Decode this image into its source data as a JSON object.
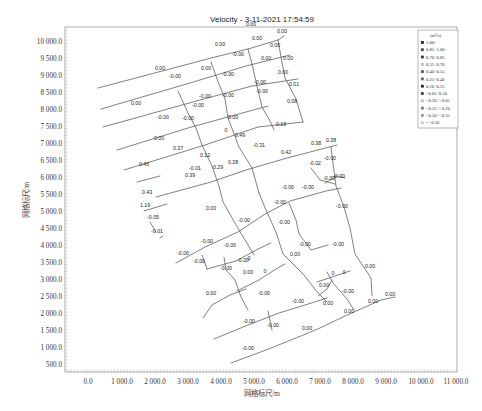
{
  "chart_data": {
    "type": "line",
    "title": "Velocity - 3-11-2021 17:54:59",
    "xlabel": "网格标尺/m",
    "ylabel": "网格标尺/m",
    "xlim": [
      -500,
      11500
    ],
    "ylim": [
      200,
      10400
    ],
    "xticks": [
      "0.0",
      "1 000.0",
      "2 000.0",
      "3 000.0",
      "4 000.0",
      "5 000.0",
      "6 000.0",
      "7 000.0",
      "8 000.0",
      "9 000.0",
      "10 000.0",
      "11 000.0"
    ],
    "yticks": [
      "10 000.0",
      "9 500.0",
      "9 000.0",
      "8 500.0",
      "8 000.0",
      "7 500.0",
      "7 000.0",
      "6 500.0",
      "6 000.0",
      "5 500.0",
      "5 000.0",
      "4 500.0",
      "4 000.0",
      "3 500.0",
      "3 000.0",
      "2 500.0",
      "2 000.0",
      "1 500.0",
      "1 000.0",
      "500.0"
    ],
    "grid": false,
    "legend_position": "upper-right",
    "legend": {
      "unit": "(m³/s)",
      "entries": [
        "1.00<",
        "0.85~1.00",
        "0.70~0.85",
        "0.55~0.70",
        "0.40~0.55",
        "0.25~0.40",
        "0.10~0.25",
        "−0.05~0.10",
        "−0.20~−0.05",
        "−0.35~−0.20",
        "−0.50~−0.35",
        "<−0.50"
      ]
    },
    "pipe_labels": [
      {
        "x": 282,
        "y": 33,
        "text": "0.00"
      },
      {
        "x": 257,
        "y": 40,
        "text": "0.00"
      },
      {
        "x": 220,
        "y": 46,
        "text": "0.00"
      },
      {
        "x": 275,
        "y": 47,
        "text": "0.00"
      },
      {
        "x": 160,
        "y": 70,
        "text": "0.00"
      },
      {
        "x": 206,
        "y": 70,
        "text": "0.00"
      },
      {
        "x": 238,
        "y": 56,
        "text": "-0.00"
      },
      {
        "x": 266,
        "y": 60,
        "text": "0.00"
      },
      {
        "x": 288,
        "y": 60,
        "text": "0.00"
      },
      {
        "x": 175,
        "y": 78,
        "text": "-0.00"
      },
      {
        "x": 228,
        "y": 76,
        "text": "-0.00"
      },
      {
        "x": 260,
        "y": 84,
        "text": "-0.00"
      },
      {
        "x": 283,
        "y": 74,
        "text": "0.00"
      },
      {
        "x": 205,
        "y": 98,
        "text": "-0.00"
      },
      {
        "x": 228,
        "y": 97,
        "text": "-0.00"
      },
      {
        "x": 262,
        "y": 93,
        "text": "-0.00"
      },
      {
        "x": 294,
        "y": 86,
        "text": "0.01"
      },
      {
        "x": 292,
        "y": 103,
        "text": "0.08"
      },
      {
        "x": 136,
        "y": 105,
        "text": "0.00"
      },
      {
        "x": 233,
        "y": 119,
        "text": "0.00"
      },
      {
        "x": 198,
        "y": 107,
        "text": "-0.00"
      },
      {
        "x": 163,
        "y": 119,
        "text": "-0.00"
      },
      {
        "x": 251,
        "y": 26,
        "text": "0.00"
      },
      {
        "x": 159,
        "y": 140,
        "text": "0.00"
      },
      {
        "x": 188,
        "y": 120,
        "text": "-0.00"
      },
      {
        "x": 226,
        "y": 132,
        "text": "0"
      },
      {
        "x": 240,
        "y": 137,
        "text": "0.49"
      },
      {
        "x": 178,
        "y": 150,
        "text": "0.37"
      },
      {
        "x": 205,
        "y": 157,
        "text": "0.12"
      },
      {
        "x": 281,
        "y": 126,
        "text": "0.19"
      },
      {
        "x": 259,
        "y": 147,
        "text": "-0.31"
      },
      {
        "x": 233,
        "y": 164,
        "text": "0.28"
      },
      {
        "x": 190,
        "y": 177,
        "text": "0.39"
      },
      {
        "x": 218,
        "y": 169,
        "text": "0.29"
      },
      {
        "x": 286,
        "y": 154,
        "text": "0.42"
      },
      {
        "x": 144,
        "y": 166,
        "text": "0.45"
      },
      {
        "x": 195,
        "y": 170,
        "text": "-0.01"
      },
      {
        "x": 147,
        "y": 194,
        "text": "0.43"
      },
      {
        "x": 316,
        "y": 145,
        "text": "0.38"
      },
      {
        "x": 331,
        "y": 142,
        "text": "0.38"
      },
      {
        "x": 330,
        "y": 160,
        "text": "-0.00"
      },
      {
        "x": 315,
        "y": 165,
        "text": "-0.02"
      },
      {
        "x": 329,
        "y": 180,
        "text": "-0.00"
      },
      {
        "x": 339,
        "y": 178,
        "text": "-0.00"
      },
      {
        "x": 288,
        "y": 189,
        "text": "-0.00"
      },
      {
        "x": 308,
        "y": 189,
        "text": "-0.00"
      },
      {
        "x": 342,
        "y": 208,
        "text": "-0.00"
      },
      {
        "x": 280,
        "y": 204,
        "text": "-0.00"
      },
      {
        "x": 211,
        "y": 210,
        "text": "0.00"
      },
      {
        "x": 244,
        "y": 222,
        "text": "-0.00"
      },
      {
        "x": 145,
        "y": 207,
        "text": "1.19"
      },
      {
        "x": 153,
        "y": 219,
        "text": "-0.05"
      },
      {
        "x": 157,
        "y": 233,
        "text": "-0.01"
      },
      {
        "x": 284,
        "y": 224,
        "text": "-0.00"
      },
      {
        "x": 305,
        "y": 246,
        "text": "-0.00"
      },
      {
        "x": 338,
        "y": 246,
        "text": "-0.00"
      },
      {
        "x": 207,
        "y": 243,
        "text": "-0.00"
      },
      {
        "x": 230,
        "y": 247,
        "text": "-0.00"
      },
      {
        "x": 183,
        "y": 255,
        "text": "-0.00"
      },
      {
        "x": 199,
        "y": 263,
        "text": "-0.00"
      },
      {
        "x": 243,
        "y": 262,
        "text": "-0.00"
      },
      {
        "x": 226,
        "y": 270,
        "text": "-0.00"
      },
      {
        "x": 249,
        "y": 260,
        "text": "0"
      },
      {
        "x": 295,
        "y": 256,
        "text": "0.00"
      },
      {
        "x": 248,
        "y": 274,
        "text": "0.00"
      },
      {
        "x": 265,
        "y": 273,
        "text": "0"
      },
      {
        "x": 370,
        "y": 268,
        "text": "0.00"
      },
      {
        "x": 211,
        "y": 295,
        "text": "0.00"
      },
      {
        "x": 264,
        "y": 295,
        "text": "-0.00"
      },
      {
        "x": 333,
        "y": 275,
        "text": "0"
      },
      {
        "x": 344,
        "y": 274,
        "text": "0"
      },
      {
        "x": 324,
        "y": 287,
        "text": "0.00"
      },
      {
        "x": 348,
        "y": 293,
        "text": "-0.00"
      },
      {
        "x": 298,
        "y": 303,
        "text": "-0.00"
      },
      {
        "x": 328,
        "y": 305,
        "text": "0.00"
      },
      {
        "x": 349,
        "y": 313,
        "text": "0.00"
      },
      {
        "x": 373,
        "y": 303,
        "text": "0.00"
      },
      {
        "x": 390,
        "y": 296,
        "text": "0.00"
      },
      {
        "x": 249,
        "y": 323,
        "text": "-0.00"
      },
      {
        "x": 273,
        "y": 327,
        "text": "-0.00"
      },
      {
        "x": 307,
        "y": 330,
        "text": "0.00"
      },
      {
        "x": 248,
        "y": 350,
        "text": "-0.00"
      }
    ]
  }
}
